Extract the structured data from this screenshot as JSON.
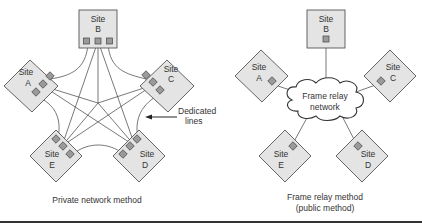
{
  "diagrams": {
    "private": {
      "caption": "Private network method",
      "annotation": {
        "line1": "Dedicated",
        "line2": "lines"
      },
      "sites": {
        "A": {
          "line1": "Site",
          "line2": "A"
        },
        "B": {
          "line1": "Site",
          "line2": "B"
        },
        "C": {
          "line1": "Site",
          "line2": "C"
        },
        "D": {
          "line1": "Site",
          "line2": "D"
        },
        "E": {
          "line1": "Site",
          "line2": "E"
        }
      }
    },
    "frame_relay": {
      "caption_line1": "Frame relay method",
      "caption_line2": "(public method)",
      "cloud": {
        "line1": "Frame relay",
        "line2": "network"
      },
      "sites": {
        "A": {
          "line1": "Site",
          "line2": "A"
        },
        "B": {
          "line1": "Site",
          "line2": "B"
        },
        "C": {
          "line1": "Site",
          "line2": "C"
        },
        "D": {
          "line1": "Site",
          "line2": "D"
        },
        "E": {
          "line1": "Site",
          "line2": "E"
        }
      }
    }
  },
  "colors": {
    "node_fill": "#e4e4e4",
    "port_fill": "#9a9a9a",
    "line": "#555555",
    "rule": "#333333"
  }
}
